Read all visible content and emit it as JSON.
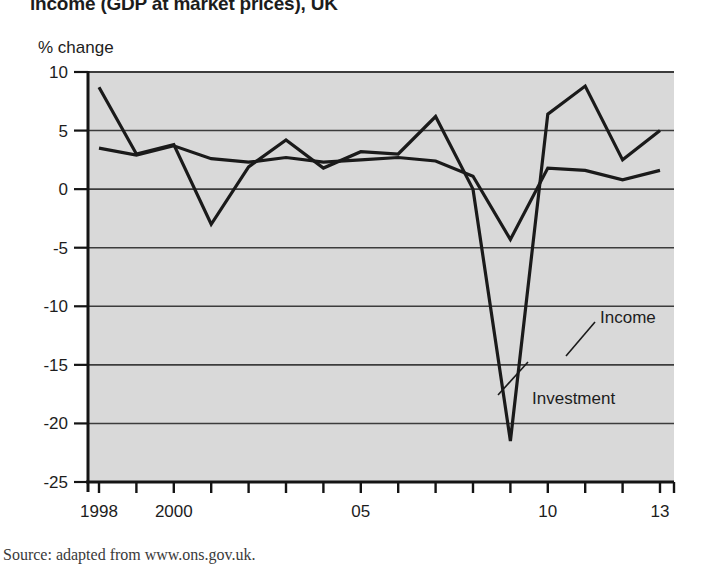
{
  "figure": {
    "title": "income (GDP at market prices), UK",
    "source": "Source: adapted from www.ons.gov.uk.",
    "y_axis_title": "% change"
  },
  "labels": {
    "income": "Income",
    "investment": "Investment"
  },
  "colors": {
    "plot_background": "#d9d9d9",
    "line": "#1a1a1a",
    "gridline": "#3c3c3c",
    "axis": "#141414",
    "page_background": "#ffffff",
    "text": "#1d1d1d"
  },
  "chart_data": {
    "type": "line",
    "title": "income (GDP at market prices), UK",
    "xlabel": "",
    "ylabel": "% change",
    "ylim": [
      -25,
      10
    ],
    "xlim": [
      1998,
      2013
    ],
    "grid": true,
    "legend": "inline-annotations",
    "yticks": [
      10,
      5,
      0,
      -5,
      -10,
      -15,
      -20,
      -25
    ],
    "ytick_labels": [
      "10",
      "5",
      "0",
      "-5",
      "-10",
      "-15",
      "-20",
      "-25"
    ],
    "x": [
      1998,
      1999,
      2000,
      2001,
      2002,
      2003,
      2004,
      2005,
      2006,
      2007,
      2008,
      2009,
      2010,
      2011,
      2012,
      2013
    ],
    "xticks": [
      1998,
      1999,
      2000,
      2001,
      2002,
      2003,
      2004,
      2005,
      2006,
      2007,
      2008,
      2009,
      2010,
      2011,
      2012,
      2013
    ],
    "xtick_labels": [
      "1998",
      "",
      "2000",
      "",
      "",
      "",
      "",
      "05",
      "",
      "",
      "",
      "",
      "10",
      "",
      "",
      "13"
    ],
    "xtick_labels_shown": [
      "1998",
      "2000",
      "05",
      "10",
      "13"
    ],
    "series": [
      {
        "name": "Investment",
        "values": [
          8.7,
          3.0,
          3.8,
          -3.0,
          1.9,
          4.2,
          1.8,
          3.2,
          3.0,
          6.2,
          0.0,
          -21.5,
          6.4,
          8.8,
          2.5,
          5.0
        ]
      },
      {
        "name": "Income",
        "values": [
          3.5,
          2.9,
          3.7,
          2.6,
          2.3,
          2.7,
          2.3,
          2.5,
          2.7,
          2.4,
          1.1,
          -4.3,
          1.8,
          1.6,
          0.8,
          1.6
        ]
      }
    ],
    "annotations": [
      {
        "text": "Income",
        "x": 2011.6,
        "y": 0.0
      },
      {
        "text": "Investment",
        "x": 2010.0,
        "y": -16.0
      }
    ]
  }
}
